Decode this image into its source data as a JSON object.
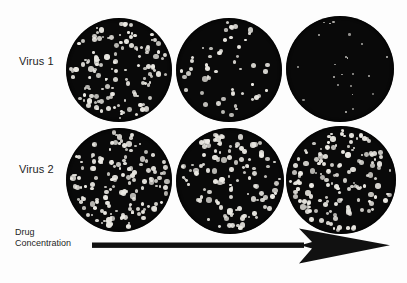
{
  "figure": {
    "title_visible": false,
    "background_color": "#fdfdfd",
    "plate_color": "#090909",
    "plaque_color": "#eceae4",
    "text_color": "#1d1d1d"
  },
  "rows": [
    {
      "label": "Virus 1"
    },
    {
      "label": "Virus 2"
    }
  ],
  "axis": {
    "label_line1": "Drug",
    "label_line2": "Concentration",
    "direction": "increasing-left-to-right",
    "arrow_icon": "right-arrow-icon"
  },
  "chart_data": {
    "type": "table",
    "xlabel": "Drug Concentration",
    "ylabel": "Virus strain",
    "categories": [
      "Low",
      "Medium",
      "High"
    ],
    "legend_position": "none",
    "grid": false,
    "series": [
      {
        "name": "Virus 1",
        "values": [
          130,
          52,
          22
        ],
        "interpretation": "drug-sensitive"
      },
      {
        "name": "Virus 2",
        "values": [
          150,
          122,
          148
        ],
        "interpretation": "drug-resistant"
      }
    ],
    "units": "plaques per plate (approximate count)"
  },
  "plates": [
    {
      "row": "Virus 1",
      "column": 1,
      "plaque_count": 130,
      "density": "high"
    },
    {
      "row": "Virus 1",
      "column": 2,
      "plaque_count": 52,
      "density": "low"
    },
    {
      "row": "Virus 1",
      "column": 3,
      "plaque_count": 22,
      "density": "very-low"
    },
    {
      "row": "Virus 2",
      "column": 1,
      "plaque_count": 150,
      "density": "high"
    },
    {
      "row": "Virus 2",
      "column": 2,
      "plaque_count": 122,
      "density": "high"
    },
    {
      "row": "Virus 2",
      "column": 3,
      "plaque_count": 148,
      "density": "high"
    }
  ]
}
